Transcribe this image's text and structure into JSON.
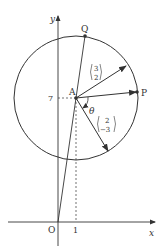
{
  "diagram": {
    "type": "geometry",
    "axes": {
      "x_label": "x",
      "y_label": "y",
      "origin_label": "O",
      "x_tick_label": "1",
      "y_tick_label": "7"
    },
    "points": {
      "A": "A",
      "P": "P",
      "Q": "Q"
    },
    "vectors": [
      {
        "name": "v1",
        "top": "3",
        "bottom": "2"
      },
      {
        "name": "v2",
        "top": "2",
        "bottom": "−3"
      }
    ],
    "angle_label": "θ",
    "colors": {
      "line": "#333333",
      "background": "#ffffff"
    }
  }
}
